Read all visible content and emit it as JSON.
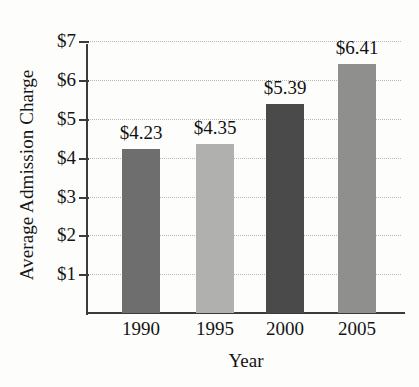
{
  "chart_data": {
    "type": "bar",
    "title": "",
    "xlabel": "Year",
    "ylabel": "Average Admission Charge",
    "categories": [
      "1990",
      "1995",
      "2000",
      "2005"
    ],
    "values": [
      4.23,
      4.35,
      5.39,
      6.41
    ],
    "value_labels": [
      "$4.23",
      "$4.35",
      "$5.39",
      "$6.41"
    ],
    "bar_colors": [
      "#6e6e6e",
      "#b0b0ae",
      "#4a4a4a",
      "#8f8f8d"
    ],
    "ylim": [
      0,
      7
    ],
    "ytick_values": [
      7,
      6,
      5,
      4,
      3,
      2,
      1
    ],
    "ytick_labels": [
      "$7",
      "$6",
      "$5",
      "$4",
      "$3",
      "$2",
      "$1"
    ],
    "grid": true,
    "grid_style": "dotted",
    "grid_axis": "y",
    "legend": "none",
    "axis_color": "#3b3b3b",
    "gridline_color": "#b9b9b4",
    "background_color": "#fdfdfc"
  }
}
